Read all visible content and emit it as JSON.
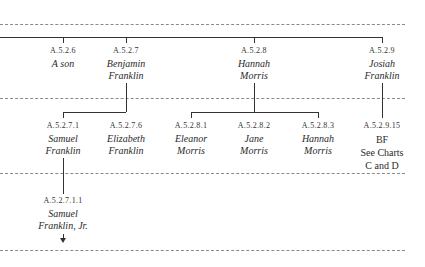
{
  "diagram": {
    "type": "genealogy-chart",
    "generations": [
      {
        "level": 1,
        "nodes": [
          {
            "code": "A.5.2.6",
            "name_lines": [
              "A son"
            ]
          },
          {
            "code": "A.5.2.7",
            "name_lines": [
              "Benjamin",
              "Franklin"
            ]
          },
          {
            "code": "A.5.2.8",
            "name_lines": [
              "Hannah",
              "Morris"
            ]
          },
          {
            "code": "A.5.2.9",
            "name_lines": [
              "Josiah",
              "Franklin"
            ]
          }
        ]
      },
      {
        "level": 2,
        "nodes": [
          {
            "code": "A.5.2.7.1",
            "name_lines": [
              "Samuel",
              "Franklin"
            ],
            "parent": "A.5.2.7"
          },
          {
            "code": "A.5.2.7.6",
            "name_lines": [
              "Elizabeth",
              "Franklin"
            ],
            "parent": "A.5.2.7"
          },
          {
            "code": "A.5.2.8.1",
            "name_lines": [
              "Eleanor",
              "Morris"
            ],
            "parent": "A.5.2.8"
          },
          {
            "code": "A.5.2.8.2",
            "name_lines": [
              "Jane",
              "Morris"
            ],
            "parent": "A.5.2.8"
          },
          {
            "code": "A.5.2.8.3",
            "name_lines": [
              "Hannah",
              "Morris"
            ],
            "parent": "A.5.2.8"
          },
          {
            "code": "A.5.2.9.15",
            "name_lines": [
              "BF"
            ],
            "note_lines": [
              "See Charts",
              "C and D"
            ],
            "parent": "A.5.2.9"
          }
        ]
      },
      {
        "level": 3,
        "nodes": [
          {
            "code": "A.5.2.7.1.1",
            "name_lines": [
              "Samuel",
              "Franklin, Jr."
            ],
            "parent": "A.5.2.7.1",
            "continues": true
          }
        ]
      }
    ]
  }
}
